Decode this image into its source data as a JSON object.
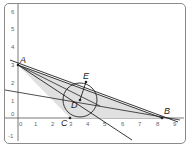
{
  "diagram": {
    "type": "geometry-construction",
    "axes": {
      "x_ticks": [
        "0",
        "1",
        "2",
        "3",
        "4",
        "5",
        "6",
        "7",
        "8",
        "9"
      ],
      "y_ticks": [
        "-1",
        "0",
        "1",
        "2",
        "3",
        "4",
        "5",
        "6"
      ]
    },
    "points": {
      "A": {
        "label": "A",
        "x": 0,
        "y": 3
      },
      "B": {
        "label": "B",
        "x": 8.3,
        "y": 0
      },
      "C": {
        "label": "C",
        "x": 3,
        "y": 0
      },
      "D": {
        "label": "D",
        "x": 3.6,
        "y": 1.0
      },
      "E": {
        "label": "E",
        "x": 3.85,
        "y": 2.2
      }
    },
    "circle": {
      "center": "D",
      "radius": 1.15
    },
    "shaded_triangle": [
      "A",
      "B",
      "C"
    ],
    "colors": {
      "shade": "#e0e0e0",
      "line": "#222222",
      "axis": "#555555"
    }
  }
}
